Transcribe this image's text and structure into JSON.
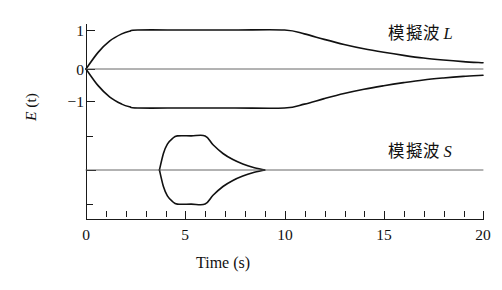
{
  "figure": {
    "x_axis_title": "Time (s)",
    "y_axis_title_main": "E",
    "y_axis_title_paren": "(t)"
  },
  "labels": {
    "wave_L": "模擬波",
    "wave_L_sym": "L",
    "wave_S": "模擬波",
    "wave_S_sym": "S"
  },
  "ticks": {
    "x": [
      "0",
      "5",
      "10",
      "15",
      "20"
    ],
    "y": [
      "1",
      "0",
      "−1"
    ]
  },
  "colors": {
    "axis": "#1a1a1a",
    "trace": "#111111",
    "baseline": "#555555",
    "background": "#ffffff"
  },
  "chart_data": {
    "type": "line",
    "title": "",
    "subtitle": "",
    "xlabel": "Time (s)",
    "ylabel": "E (t)",
    "xlim": [
      0,
      20
    ],
    "x_major_ticks": [
      0,
      5,
      10,
      15,
      20
    ],
    "x_minor_tick_interval": 1,
    "grid": false,
    "legend": "inline annotations at right of each trace",
    "panels": [
      {
        "name": "模擬波 L",
        "description": "Synthetic long-period (L) wave envelope: rises from 0 at t=0 to plateau at amplitude 1 by t=2.6 s, holds flat until t=10 s, then decays smoothly to about 0.15 at t=20 s. Mirrored negative envelope below, with a flat zero baseline between them.",
        "ylim": [
          -1.35,
          1.35
        ],
        "y_ticks": [
          1,
          0,
          -1
        ],
        "series": [
          {
            "name": "upper envelope",
            "x": [
              0,
              0.6,
              1.2,
              1.8,
              2.2,
              2.6,
              5,
              7.5,
              10,
              11,
              12,
              13,
              14,
              15,
              16,
              17,
              18,
              19,
              20
            ],
            "values": [
              0.0,
              0.42,
              0.72,
              0.9,
              0.97,
              1.0,
              1.0,
              1.0,
              1.0,
              0.9,
              0.76,
              0.63,
              0.52,
              0.43,
              0.35,
              0.28,
              0.23,
              0.19,
              0.16
            ]
          },
          {
            "name": "lower envelope",
            "x": [
              0,
              0.6,
              1.2,
              1.8,
              2.2,
              2.6,
              5,
              7.5,
              10,
              11,
              12,
              13,
              14,
              15,
              16,
              17,
              18,
              19,
              20
            ],
            "values": [
              0.0,
              -0.42,
              -0.72,
              -0.9,
              -0.97,
              -1.0,
              -1.0,
              -1.0,
              -1.0,
              -0.9,
              -0.76,
              -0.63,
              -0.52,
              -0.43,
              -0.35,
              -0.28,
              -0.23,
              -0.19,
              -0.16
            ]
          },
          {
            "name": "zero baseline",
            "x": [
              0,
              20
            ],
            "values": [
              0,
              0
            ]
          }
        ]
      },
      {
        "name": "模擬波 S",
        "description": "Synthetic shear (S) wave envelope: narrow spindle beginning at t=3.7 s, widening to a flat plateau of amplitude 0.62 between t=4.6 and t=6.0 s, then tapering to zero by t=9.0 s. Mirrored negative envelope below, with a flat zero baseline extending to t=20 s.",
        "ylim": [
          -0.95,
          0.95
        ],
        "y_ticks": [],
        "series": [
          {
            "name": "upper envelope",
            "x": [
              3.7,
              3.9,
              4.1,
              4.35,
              4.6,
              5.3,
              6.0,
              6.4,
              6.9,
              7.4,
              7.9,
              8.4,
              9.0
            ],
            "values": [
              0.0,
              0.3,
              0.47,
              0.57,
              0.62,
              0.62,
              0.62,
              0.46,
              0.3,
              0.19,
              0.11,
              0.05,
              0.0
            ]
          },
          {
            "name": "lower envelope",
            "x": [
              3.7,
              3.9,
              4.1,
              4.35,
              4.6,
              5.3,
              6.0,
              6.4,
              6.9,
              7.4,
              7.9,
              8.4,
              9.0
            ],
            "values": [
              0.0,
              -0.3,
              -0.47,
              -0.57,
              -0.62,
              -0.62,
              -0.62,
              -0.46,
              -0.3,
              -0.19,
              -0.11,
              -0.05,
              0.0
            ]
          },
          {
            "name": "zero baseline",
            "x": [
              0,
              20
            ],
            "values": [
              0,
              0
            ]
          }
        ]
      }
    ]
  }
}
